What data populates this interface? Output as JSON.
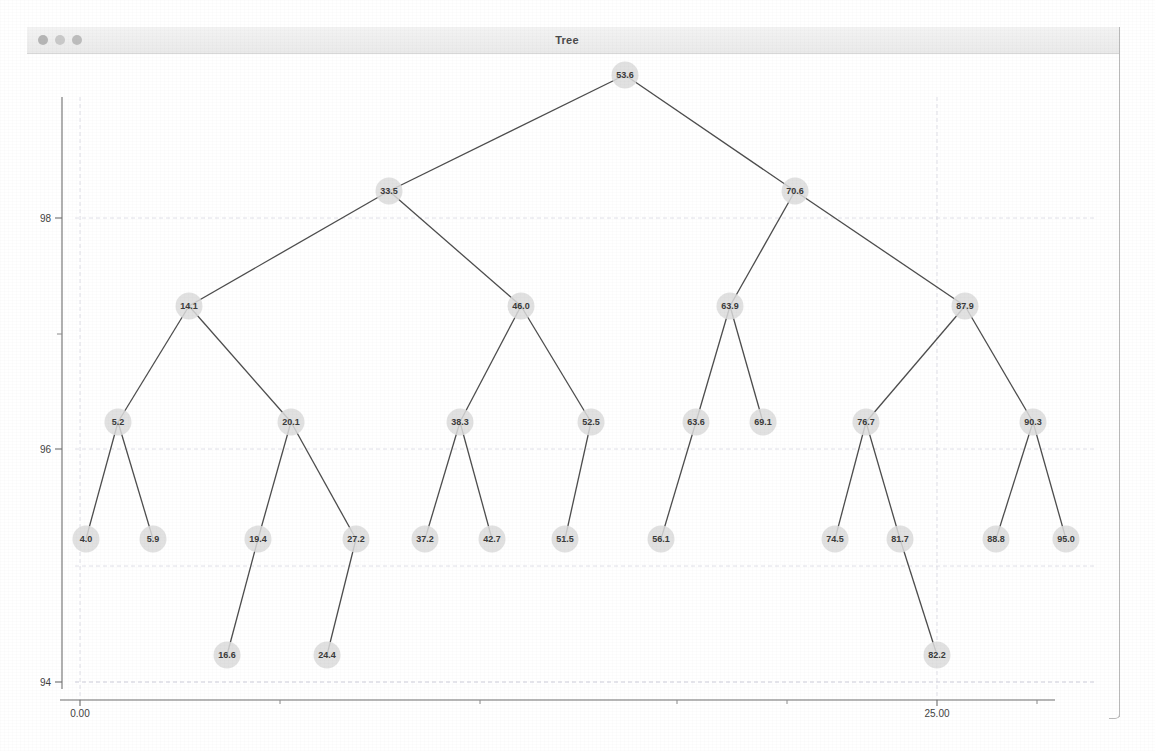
{
  "window": {
    "title": "Tree",
    "traffic_lights": [
      "close-dot",
      "minimize-dot",
      "zoom-dot"
    ]
  },
  "axes": {
    "y_ticks": [
      {
        "label": "98",
        "value": 98
      },
      {
        "label": "96",
        "value": 96
      },
      {
        "label": "94",
        "value": 94
      }
    ],
    "x_ticks": [
      {
        "label": "0.00",
        "value": 0
      },
      {
        "label": "25.00",
        "value": 25
      }
    ]
  },
  "chart_data": {
    "type": "diagram",
    "title": "Tree",
    "xlabel": "",
    "ylabel": "",
    "xlim": [
      0,
      28.5
    ],
    "ylim": [
      93.2,
      99.4
    ],
    "grid": true,
    "legend": null,
    "nodes": [
      {
        "id": "n53_6",
        "label": "53.6",
        "x": 625,
        "y": 75,
        "depth": 0
      },
      {
        "id": "n33_5",
        "label": "33.5",
        "x": 389,
        "y": 191,
        "depth": 1
      },
      {
        "id": "n70_6",
        "label": "70.6",
        "x": 795,
        "y": 191,
        "depth": 1
      },
      {
        "id": "n14_1",
        "label": "14.1",
        "x": 189,
        "y": 306,
        "depth": 2
      },
      {
        "id": "n46_0",
        "label": "46.0",
        "x": 521,
        "y": 306,
        "depth": 2
      },
      {
        "id": "n63_9",
        "label": "63.9",
        "x": 730,
        "y": 306,
        "depth": 2
      },
      {
        "id": "n87_9",
        "label": "87.9",
        "x": 965,
        "y": 306,
        "depth": 2
      },
      {
        "id": "n5_2",
        "label": "5.2",
        "x": 118,
        "y": 422,
        "depth": 3
      },
      {
        "id": "n20_1",
        "label": "20.1",
        "x": 291,
        "y": 422,
        "depth": 3
      },
      {
        "id": "n38_3",
        "label": "38.3",
        "x": 460,
        "y": 422,
        "depth": 3
      },
      {
        "id": "n52_5",
        "label": "52.5",
        "x": 591,
        "y": 422,
        "depth": 3
      },
      {
        "id": "n63_6",
        "label": "63.6",
        "x": 696,
        "y": 422,
        "depth": 3
      },
      {
        "id": "n69_1",
        "label": "69.1",
        "x": 763,
        "y": 422,
        "depth": 3
      },
      {
        "id": "n76_7",
        "label": "76.7",
        "x": 866,
        "y": 422,
        "depth": 3
      },
      {
        "id": "n90_3",
        "label": "90.3",
        "x": 1033,
        "y": 422,
        "depth": 3
      },
      {
        "id": "n4_0",
        "label": "4.0",
        "x": 86,
        "y": 539,
        "depth": 4
      },
      {
        "id": "n5_9",
        "label": "5.9",
        "x": 153,
        "y": 539,
        "depth": 4
      },
      {
        "id": "n19_4",
        "label": "19.4",
        "x": 258,
        "y": 539,
        "depth": 4
      },
      {
        "id": "n27_2",
        "label": "27.2",
        "x": 356,
        "y": 539,
        "depth": 4
      },
      {
        "id": "n37_2",
        "label": "37.2",
        "x": 425,
        "y": 539,
        "depth": 4
      },
      {
        "id": "n42_7",
        "label": "42.7",
        "x": 492,
        "y": 539,
        "depth": 4
      },
      {
        "id": "n51_5",
        "label": "51.5",
        "x": 565,
        "y": 539,
        "depth": 4
      },
      {
        "id": "n56_1",
        "label": "56.1",
        "x": 661,
        "y": 539,
        "depth": 4
      },
      {
        "id": "n74_5",
        "label": "74.5",
        "x": 835,
        "y": 539,
        "depth": 4
      },
      {
        "id": "n81_7",
        "label": "81.7",
        "x": 900,
        "y": 539,
        "depth": 4
      },
      {
        "id": "n88_8",
        "label": "88.8",
        "x": 996,
        "y": 539,
        "depth": 4
      },
      {
        "id": "n95_0",
        "label": "95.0",
        "x": 1066,
        "y": 539,
        "depth": 4
      },
      {
        "id": "n16_6",
        "label": "16.6",
        "x": 227,
        "y": 655,
        "depth": 5
      },
      {
        "id": "n24_4",
        "label": "24.4",
        "x": 327,
        "y": 655,
        "depth": 5
      },
      {
        "id": "n82_2",
        "label": "82.2",
        "x": 937,
        "y": 655,
        "depth": 5
      }
    ],
    "edges": [
      {
        "from": "n53_6",
        "to": "n33_5"
      },
      {
        "from": "n53_6",
        "to": "n70_6"
      },
      {
        "from": "n33_5",
        "to": "n14_1"
      },
      {
        "from": "n33_5",
        "to": "n46_0"
      },
      {
        "from": "n70_6",
        "to": "n63_9"
      },
      {
        "from": "n70_6",
        "to": "n87_9"
      },
      {
        "from": "n14_1",
        "to": "n5_2"
      },
      {
        "from": "n14_1",
        "to": "n20_1"
      },
      {
        "from": "n46_0",
        "to": "n38_3"
      },
      {
        "from": "n46_0",
        "to": "n52_5"
      },
      {
        "from": "n63_9",
        "to": "n63_6"
      },
      {
        "from": "n63_9",
        "to": "n69_1"
      },
      {
        "from": "n87_9",
        "to": "n76_7"
      },
      {
        "from": "n87_9",
        "to": "n90_3"
      },
      {
        "from": "n5_2",
        "to": "n4_0"
      },
      {
        "from": "n5_2",
        "to": "n5_9"
      },
      {
        "from": "n20_1",
        "to": "n19_4"
      },
      {
        "from": "n20_1",
        "to": "n27_2"
      },
      {
        "from": "n38_3",
        "to": "n37_2"
      },
      {
        "from": "n38_3",
        "to": "n42_7"
      },
      {
        "from": "n52_5",
        "to": "n51_5"
      },
      {
        "from": "n63_6",
        "to": "n56_1"
      },
      {
        "from": "n76_7",
        "to": "n74_5"
      },
      {
        "from": "n76_7",
        "to": "n81_7"
      },
      {
        "from": "n90_3",
        "to": "n88_8"
      },
      {
        "from": "n90_3",
        "to": "n95_0"
      },
      {
        "from": "n19_4",
        "to": "n16_6"
      },
      {
        "from": "n27_2",
        "to": "n24_4"
      },
      {
        "from": "n81_7",
        "to": "n82_2"
      }
    ]
  }
}
